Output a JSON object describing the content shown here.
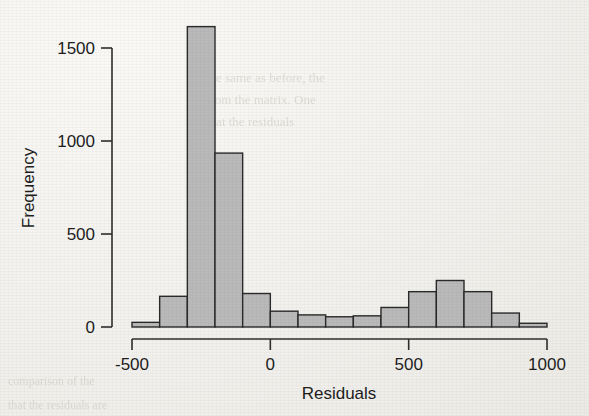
{
  "figure": {
    "background_color": "#f1f0ec",
    "bar_fill_color": "#b9b9b9",
    "bar_stroke_color": "#2a2a2a",
    "axis_color": "#2e2e2e"
  },
  "axes": {
    "x_title": "Residuals",
    "y_title": "Frequency",
    "x_ticks": [
      "-500",
      "0",
      "500",
      "1000"
    ],
    "y_ticks": [
      "0",
      "500",
      "1000",
      "1500"
    ]
  },
  "ghost_text": [
    {
      "text": "the same as before, the",
      "x": 206,
      "y": 70,
      "size": 13
    },
    {
      "text": "from the matrix. One",
      "x": 206,
      "y": 92,
      "size": 13
    },
    {
      "text": "that the residuals",
      "x": 206,
      "y": 114,
      "size": 13
    },
    {
      "text": "comparison of the",
      "x": 8,
      "y": 374,
      "size": 12
    },
    {
      "text": "that the residuals are",
      "x": 8,
      "y": 398,
      "size": 12
    }
  ],
  "chart_data": {
    "type": "bar",
    "title": "",
    "subtitle": "",
    "xlabel": "Residuals",
    "ylabel": "Frequency",
    "xlim": [
      -500,
      1000
    ],
    "ylim": [
      0,
      1700
    ],
    "grid": false,
    "legend": false,
    "bin_width": 100,
    "bin_edges": [
      -500,
      -400,
      -300,
      -200,
      -100,
      0,
      100,
      200,
      300,
      400,
      500,
      600,
      700,
      800,
      900,
      1000
    ],
    "categories": [
      "-500 to -400",
      "-400 to -300",
      "-300 to -200",
      "-200 to -100",
      "-100 to 0",
      "0 to 100",
      "100 to 200",
      "200 to 300",
      "300 to 400",
      "400 to 500",
      "500 to 600",
      "600 to 700",
      "700 to 800",
      "800 to 900",
      "900 to 1000"
    ],
    "values": [
      25,
      165,
      1615,
      935,
      180,
      85,
      65,
      55,
      60,
      105,
      190,
      250,
      190,
      75,
      20
    ],
    "axis_ticks": {
      "x": [
        -500,
        0,
        500,
        1000
      ],
      "y": [
        0,
        500,
        1000,
        1500
      ]
    }
  }
}
